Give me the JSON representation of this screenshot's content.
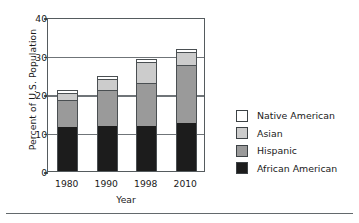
{
  "chart_data": {
    "type": "bar",
    "subtype": "stacked-vertical",
    "title": "",
    "xlabel": "Year",
    "ylabel": "Percent of U.S. Population",
    "categories": [
      "1980",
      "1990",
      "1998",
      "2010"
    ],
    "ylim": [
      0,
      40
    ],
    "yticks": [
      0,
      10,
      20,
      30,
      40
    ],
    "ytick_labels": [
      "0",
      "10",
      "20",
      "30",
      "40"
    ],
    "grid": true,
    "grid_axis": "y",
    "legend_position": "right",
    "series": [
      {
        "name": "African American",
        "color": "#1c1c1c",
        "values": [
          11.5,
          11.7,
          11.8,
          12.5
        ]
      },
      {
        "name": "Hispanic",
        "color": "#9a9a9a",
        "values": [
          7.0,
          9.3,
          11.0,
          15.0
        ]
      },
      {
        "name": "Asian",
        "color": "#cccccc",
        "values": [
          1.7,
          3.0,
          5.5,
          3.5
        ]
      },
      {
        "name": "Native American",
        "color": "#ffffff",
        "values": [
          0.8,
          0.8,
          0.7,
          0.8
        ]
      }
    ],
    "totals": [
      21.0,
      24.8,
      29.0,
      31.8
    ]
  },
  "axes": {
    "y_title": "Percent of U.S. Population",
    "x_title": "Year",
    "y_ticks": [
      {
        "label": "40",
        "value": 40
      },
      {
        "label": "30",
        "value": 30
      },
      {
        "label": "20",
        "value": 20
      },
      {
        "label": "10",
        "value": 10
      },
      {
        "label": "0",
        "value": 0
      }
    ],
    "x_ticks": [
      {
        "label": "1980"
      },
      {
        "label": "1990"
      },
      {
        "label": "1998"
      },
      {
        "label": "2010"
      }
    ]
  },
  "legend": {
    "entries": [
      {
        "label": "Native American",
        "color": "#ffffff"
      },
      {
        "label": "Asian",
        "color": "#cccccc"
      },
      {
        "label": "Hispanic",
        "color": "#9a9a9a"
      },
      {
        "label": "African American",
        "color": "#1c1c1c"
      }
    ]
  }
}
